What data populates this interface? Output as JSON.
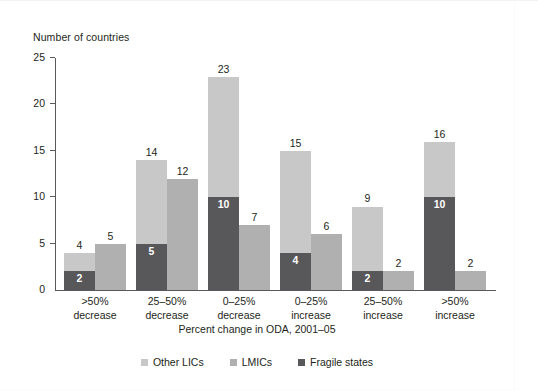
{
  "chart_data": {
    "type": "bar",
    "title": "",
    "ylabel": "Number of countries",
    "xlabel": "Percent change in ODA, 2001–05",
    "ylim": [
      0,
      25
    ],
    "yticks": [
      0,
      5,
      10,
      15,
      20,
      25
    ],
    "grid": false,
    "legend_position": "bottom",
    "bar_style": "grouped-pairs; left bar stacked (Fragile states bottom + Other LICs top), right bar single (LMICs)",
    "categories": [
      ">50% decrease",
      "25–50% decrease",
      "0–25% decrease",
      "0–25% increase",
      "25–50% increase",
      ">50% increase"
    ],
    "category_lines": [
      [
        ">50%",
        "decrease"
      ],
      [
        "25–50%",
        "decrease"
      ],
      [
        "0–25%",
        "decrease"
      ],
      [
        "0–25%",
        "increase"
      ],
      [
        "25–50%",
        "increase"
      ],
      [
        ">50%",
        "increase"
      ]
    ],
    "series": [
      {
        "name": "Fragile states",
        "color": "#58575a",
        "stack": "lic",
        "values": [
          2,
          5,
          10,
          4,
          2,
          10
        ]
      },
      {
        "name": "Other LICs",
        "color": "#c8c8c8",
        "stack": "lic",
        "values": [
          2,
          9,
          13,
          11,
          7,
          6
        ]
      },
      {
        "name": "LMICs",
        "color": "#b0b0b0",
        "stack": "lmic",
        "values": [
          5,
          12,
          7,
          6,
          2,
          2
        ]
      }
    ],
    "stacked_totals": [
      4,
      14,
      23,
      15,
      9,
      16
    ],
    "labels": {
      "lic_totals": [
        "4",
        "14",
        "23",
        "15",
        "9",
        "16"
      ],
      "fragile_inner": [
        "2",
        "5",
        "10",
        "4",
        "2",
        "10"
      ],
      "lmic_totals": [
        "5",
        "12",
        "7",
        "6",
        "2",
        "2"
      ]
    }
  },
  "legend": {
    "items": [
      {
        "label": "Other LICs",
        "color": "#c8c8c8"
      },
      {
        "label": "LMICs",
        "color": "#b0b0b0"
      },
      {
        "label": "Fragile states",
        "color": "#58575a"
      }
    ]
  },
  "axis": {
    "y_title": "Number of countries",
    "y_tick_labels": [
      "25",
      "20",
      "15",
      "10",
      "5",
      "0"
    ],
    "x_title": "Percent change in ODA, 2001–05"
  }
}
